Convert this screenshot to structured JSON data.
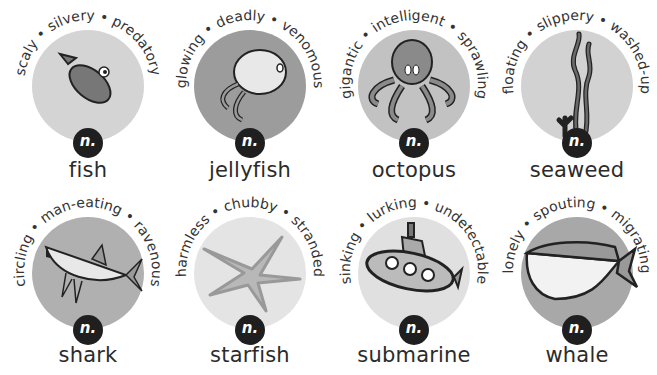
{
  "cards": [
    {
      "noun": "fish",
      "badge": "n.",
      "adj": [
        "scaly",
        "silvery",
        "predatory"
      ],
      "circle_color": "#d4d4d4",
      "icon": "fish-icon"
    },
    {
      "noun": "jellyfish",
      "badge": "n.",
      "adj": [
        "glowing",
        "deadly",
        "venomous"
      ],
      "circle_color": "#9c9c9c",
      "icon": "jellyfish-icon"
    },
    {
      "noun": "octopus",
      "badge": "n.",
      "adj": [
        "gigantic",
        "intelligent",
        "sprawling"
      ],
      "circle_color": "#c2c2c2",
      "icon": "octopus-icon"
    },
    {
      "noun": "seaweed",
      "badge": "n.",
      "adj": [
        "floating",
        "slippery",
        "washed-up"
      ],
      "circle_color": "#d2d2d2",
      "icon": "seaweed-icon"
    },
    {
      "noun": "shark",
      "badge": "n.",
      "adj": [
        "circling",
        "man-eating",
        "ravenous"
      ],
      "circle_color": "#b0b0b0",
      "icon": "shark-icon"
    },
    {
      "noun": "starfish",
      "badge": "n.",
      "adj": [
        "harmless",
        "chubby",
        "stranded"
      ],
      "circle_color": "#e4e4e4",
      "icon": "starfish-icon"
    },
    {
      "noun": "submarine",
      "badge": "n.",
      "adj": [
        "sinking",
        "lurking",
        "undetectable"
      ],
      "circle_color": "#e0e0e0",
      "icon": "submarine-icon"
    },
    {
      "noun": "whale",
      "badge": "n.",
      "adj": [
        "lonely",
        "spouting",
        "migrating"
      ],
      "circle_color": "#a8a8a8",
      "icon": "whale-icon"
    }
  ]
}
